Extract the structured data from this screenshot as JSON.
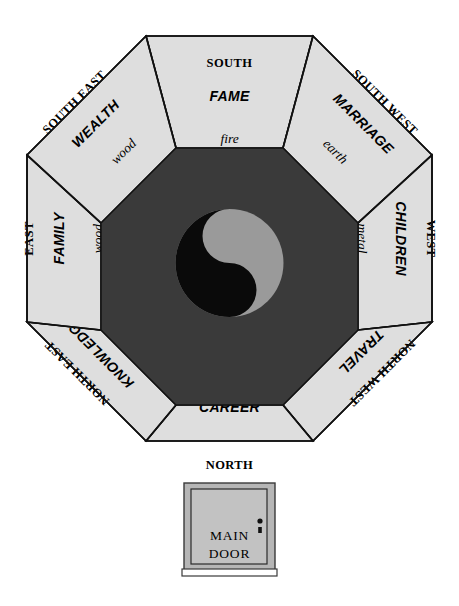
{
  "diagram": {
    "colors": {
      "background": "#ffffff",
      "sector_fill": "#dedede",
      "core_fill": "#3a3a3a",
      "outline": "#111111",
      "yin_dark": "#0a0a0a",
      "yang_light": "#9a9a9a",
      "door_fill": "#c2c2c2",
      "door_frame": "#b6b6b6"
    },
    "center_symbol": "yin-yang-symbol",
    "sectors": [
      {
        "id": "south",
        "direction": "SOUTH",
        "aspect": "FAME",
        "element": "fire"
      },
      {
        "id": "south-west",
        "direction": "SOUTH WEST",
        "aspect": "MARRIAGE",
        "element": "earth"
      },
      {
        "id": "west",
        "direction": "WEST",
        "aspect": "CHILDREN",
        "element": "metal"
      },
      {
        "id": "north-west",
        "direction": "NORTH WEST",
        "aspect": "TRAVEL",
        "element": "metal"
      },
      {
        "id": "north",
        "direction": "NORTH",
        "aspect": "CAREER",
        "element": "water"
      },
      {
        "id": "north-east",
        "direction": "NORTH EAST",
        "aspect": "KNOWLEDGE",
        "element": "earth"
      },
      {
        "id": "east",
        "direction": "EAST",
        "aspect": "FAMILY",
        "element": "wood"
      },
      {
        "id": "south-east",
        "direction": "SOUTH EAST",
        "aspect": "WEALTH",
        "element": "wood"
      }
    ],
    "door": {
      "line1": "MAIN",
      "line2": "DOOR"
    }
  }
}
